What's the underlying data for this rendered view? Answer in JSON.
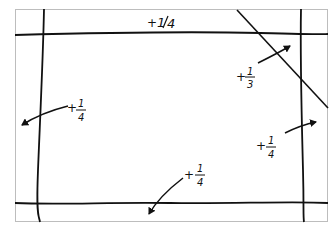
{
  "diagram": {
    "background": "#ffffff",
    "frame_color": "#bdbdbd",
    "ink_color": "#111111",
    "labels": [
      {
        "id": "top",
        "text": "+1/4",
        "sign": "+",
        "num": "1",
        "den": "4",
        "style": "slash"
      },
      {
        "id": "upper-right",
        "text": "+1/3",
        "sign": "+",
        "num": "1",
        "den": "3",
        "style": "stacked"
      },
      {
        "id": "left",
        "text": "+1/4",
        "sign": "+",
        "num": "1",
        "den": "4",
        "style": "stacked"
      },
      {
        "id": "right",
        "text": "+1/4",
        "sign": "+",
        "num": "1",
        "den": "4",
        "style": "stacked"
      },
      {
        "id": "bottom",
        "text": "+1/4",
        "sign": "+",
        "num": "1",
        "den": "4",
        "style": "stacked"
      }
    ]
  }
}
